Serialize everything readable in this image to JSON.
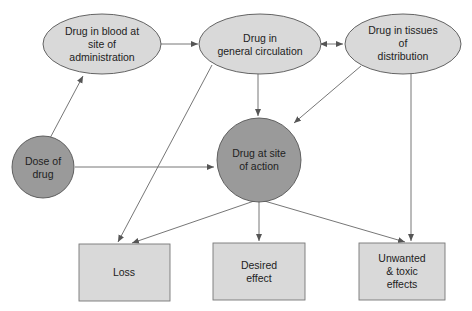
{
  "diagram": {
    "colors": {
      "light_fill": "#d9d9d9",
      "dark_fill": "#9a9a9a",
      "stroke": "#555555",
      "arrow": "#555555"
    },
    "nodes": {
      "blood_admin": {
        "lines": [
          "Drug in blood at",
          "site of",
          "administration"
        ]
      },
      "general_circulation": {
        "lines": [
          "Drug in",
          "general circulation"
        ]
      },
      "tissues": {
        "lines": [
          "Drug in tissues",
          "of",
          "distribution"
        ]
      },
      "dose": {
        "lines": [
          "Dose of",
          "drug"
        ]
      },
      "site_of_action": {
        "lines": [
          "Drug at site",
          "of action"
        ]
      },
      "loss": {
        "lines": [
          "Loss"
        ]
      },
      "desired_effect": {
        "lines": [
          "Desired",
          "effect"
        ]
      },
      "unwanted_effects": {
        "lines": [
          "Unwanted",
          "& toxic",
          "effects"
        ]
      }
    },
    "edges": [
      {
        "from": "dose",
        "to": "blood_admin"
      },
      {
        "from": "blood_admin",
        "to": "general_circulation"
      },
      {
        "from": "general_circulation",
        "to": "tissues",
        "bidirectional": true
      },
      {
        "from": "general_circulation",
        "to": "site_of_action"
      },
      {
        "from": "tissues",
        "to": "site_of_action"
      },
      {
        "from": "dose",
        "to": "site_of_action"
      },
      {
        "from": "general_circulation",
        "to": "loss"
      },
      {
        "from": "site_of_action",
        "to": "loss"
      },
      {
        "from": "site_of_action",
        "to": "desired_effect"
      },
      {
        "from": "site_of_action",
        "to": "unwanted_effects"
      },
      {
        "from": "tissues",
        "to": "unwanted_effects"
      }
    ]
  }
}
